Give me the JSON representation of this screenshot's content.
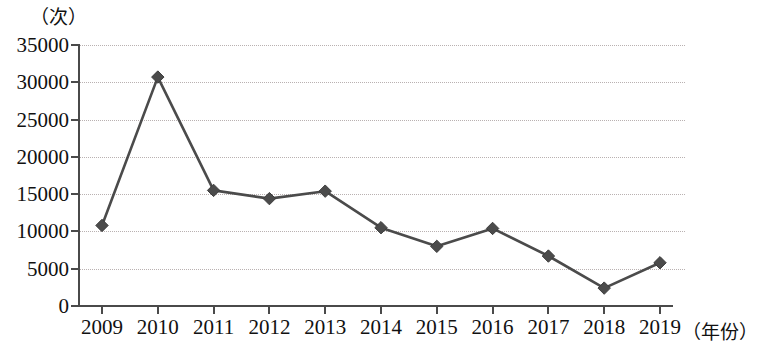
{
  "chart_data": {
    "type": "line",
    "title": "",
    "subtitle": "",
    "ylabel": "（次）",
    "xlabel": "（年份）",
    "categories": [
      "2009",
      "2010",
      "2011",
      "2012",
      "2013",
      "2014",
      "2015",
      "2016",
      "2017",
      "2018",
      "2019"
    ],
    "series": [
      {
        "name": "次数",
        "values": [
          10800,
          30700,
          15500,
          14400,
          15400,
          10500,
          8000,
          10400,
          6700,
          2400,
          5800
        ]
      }
    ],
    "ylim": [
      0,
      35000
    ],
    "ytick_labels": [
      "0",
      "5000",
      "10000",
      "15000",
      "20000",
      "25000",
      "30000",
      "35000"
    ],
    "ytick_values": [
      0,
      5000,
      10000,
      15000,
      20000,
      25000,
      30000,
      35000
    ],
    "xtick_labels": [
      "2009",
      "2010",
      "2011",
      "2012",
      "2013",
      "2014",
      "2015",
      "2016",
      "2017",
      "2018",
      "2019"
    ],
    "grid": true,
    "legend": false,
    "legend_position": "none",
    "marker": "diamond",
    "colors": {
      "line": "#4b4b4b",
      "marker": "#4b4b4b",
      "grid": "#b9b1b1",
      "axis": "#4a4a4a",
      "text": "#111111",
      "background": "#ffffff"
    }
  }
}
